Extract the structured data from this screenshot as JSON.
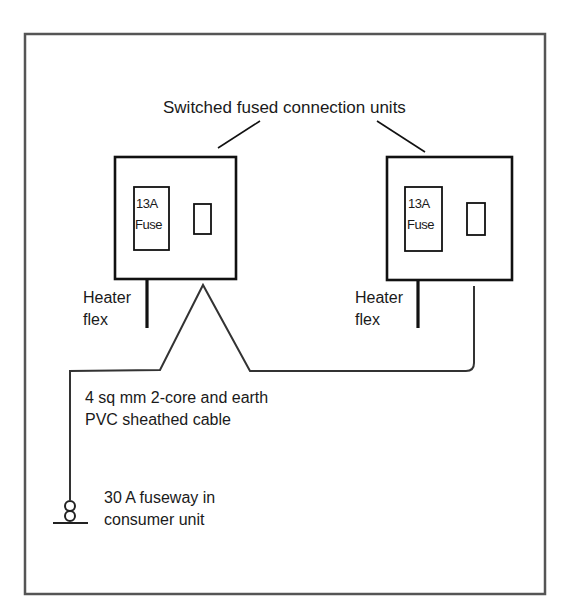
{
  "diagram": {
    "title": "Switched fused connection units",
    "units": [
      {
        "id": "left",
        "fuse_rating": "13A",
        "fuse_label": "Fuse",
        "flex_label_line1": "Heater",
        "flex_label_line2": "flex"
      },
      {
        "id": "right",
        "fuse_rating": "13A",
        "fuse_label": "Fuse",
        "flex_label_line1": "Heater",
        "flex_label_line2": "flex"
      }
    ],
    "cable": {
      "line1": "4 sq mm 2-core and earth",
      "line2": "PVC sheathed cable"
    },
    "supply": {
      "line1": "30 A fuseway in",
      "line2": "consumer unit"
    },
    "colors": {
      "stroke": "#111111",
      "frame": "#555555",
      "background": "#ffffff"
    }
  }
}
